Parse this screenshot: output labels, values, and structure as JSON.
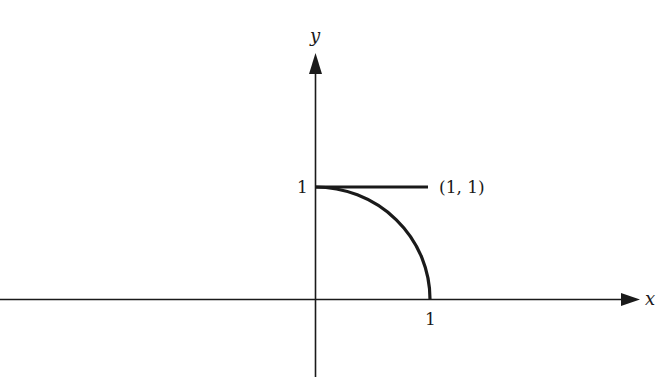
{
  "figure": {
    "axes": {
      "x_label": "x",
      "y_label": "y",
      "x_tick": "1",
      "y_tick": "1"
    },
    "point_label": "(1, 1)",
    "colors": {
      "ink": "#1a1a1a",
      "background": "#ffffff"
    }
  }
}
